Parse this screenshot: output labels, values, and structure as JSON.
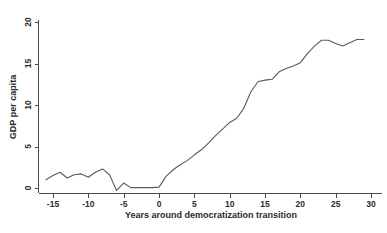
{
  "chart_data": {
    "type": "line",
    "title": "",
    "subtitle": "",
    "xlabel": "Years around democratization transition",
    "ylabel": "GDP per capita",
    "xlim": [
      -16.5,
      30.5
    ],
    "ylim": [
      -0.9,
      20.6
    ],
    "xticks": [
      -15,
      -10,
      -5,
      0,
      5,
      10,
      15,
      20,
      25,
      30
    ],
    "xtick_labels": [
      "-15",
      "-10",
      "-5",
      "0",
      "5",
      "10",
      "15",
      "20",
      "25",
      "30"
    ],
    "yticks": [
      0,
      5,
      10,
      15,
      20
    ],
    "ytick_labels": [
      "0",
      "5",
      "10",
      "15",
      "20"
    ],
    "grid": false,
    "legend": null,
    "legend_position": "none",
    "line_color": "#5a5a5a",
    "axis_color": "#4a4a4a",
    "background_color": "#ffffff",
    "series": [
      {
        "name": "GDP per capita",
        "x": [
          -16,
          -15,
          -14,
          -13,
          -12,
          -11,
          -10,
          -9,
          -8,
          -7,
          -6,
          -5,
          -4,
          -3,
          -2,
          -1,
          0,
          1,
          2,
          3,
          4,
          5,
          6,
          7,
          8,
          9,
          10,
          11,
          12,
          13,
          14,
          15,
          16,
          17,
          18,
          19,
          20,
          21,
          22,
          23,
          24,
          25,
          26,
          27,
          28,
          29
        ],
        "values": [
          1.0,
          1.5,
          1.9,
          1.2,
          1.6,
          1.7,
          1.3,
          1.9,
          2.3,
          1.6,
          -0.3,
          0.6,
          0.05,
          0.05,
          0.05,
          0.05,
          0.1,
          1.4,
          2.2,
          2.8,
          3.3,
          4.0,
          4.6,
          5.4,
          6.3,
          7.1,
          7.9,
          8.4,
          9.6,
          11.6,
          12.8,
          13.0,
          13.1,
          14.0,
          14.4,
          14.7,
          15.1,
          16.2,
          17.1,
          17.8,
          17.8,
          17.4,
          17.1,
          17.5,
          17.9,
          17.9
        ]
      }
    ]
  },
  "axis": {
    "ylabel": "GDP per capita",
    "xlabel": "Years around democratization transition"
  }
}
